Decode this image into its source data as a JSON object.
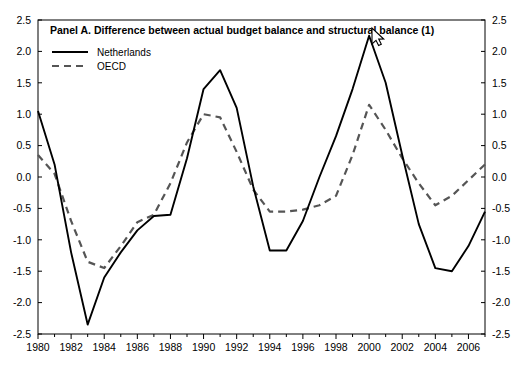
{
  "chart_data": {
    "type": "line",
    "title": "Panel A. Difference between actual budget balance and structural balance (1)",
    "xlabel": "",
    "ylabel": "",
    "ylim": [
      -2.5,
      2.5
    ],
    "xlim": [
      1980,
      2007
    ],
    "grid": false,
    "legend_position": "top-left",
    "y_ticks": [
      "2.5",
      "2.0",
      "1.5",
      "1.0",
      "0.5",
      "0.0",
      "-0.5",
      "-1.0",
      "-1.5",
      "-2.0",
      "-2.5"
    ],
    "y_tick_values": [
      2.5,
      2.0,
      1.5,
      1.0,
      0.5,
      0.0,
      -0.5,
      -1.0,
      -1.5,
      -2.0,
      -2.5
    ],
    "x_tick_labels": [
      "1980",
      "1982",
      "1984",
      "1986",
      "1988",
      "1990",
      "1992",
      "1994",
      "1996",
      "1998",
      "2000",
      "2002",
      "2004",
      "2006"
    ],
    "x_tick_values": [
      1980,
      1982,
      1984,
      1986,
      1988,
      1990,
      1992,
      1994,
      1996,
      1998,
      2000,
      2002,
      2004,
      2006
    ],
    "x": [
      1980,
      1981,
      1982,
      1983,
      1984,
      1985,
      1986,
      1987,
      1988,
      1989,
      1990,
      1991,
      1992,
      1993,
      1994,
      1995,
      1996,
      1997,
      1998,
      1999,
      2000,
      2001,
      2002,
      2003,
      2004,
      2005,
      2006,
      2007
    ],
    "series": [
      {
        "name": "Netherlands",
        "style": "solid",
        "color": "#000000",
        "values": [
          1.05,
          0.2,
          -1.2,
          -2.35,
          -1.6,
          -1.2,
          -0.85,
          -0.62,
          -0.6,
          0.3,
          1.4,
          1.7,
          1.1,
          -0.15,
          -1.17,
          -1.17,
          -0.7,
          0.0,
          0.65,
          1.4,
          2.25,
          1.5,
          0.35,
          -0.75,
          -1.45,
          -1.5,
          -1.1,
          -0.55
        ]
      },
      {
        "name": "OECD",
        "style": "dashed",
        "color": "#000000",
        "values": [
          0.35,
          0.05,
          -0.7,
          -1.35,
          -1.45,
          -1.1,
          -0.72,
          -0.6,
          -0.1,
          0.55,
          1.0,
          0.95,
          0.4,
          -0.2,
          -0.55,
          -0.55,
          -0.52,
          -0.45,
          -0.3,
          0.35,
          1.15,
          0.75,
          0.3,
          -0.1,
          -0.45,
          -0.3,
          -0.05,
          0.2
        ]
      }
    ]
  },
  "legend": {
    "items": [
      {
        "label": "Netherlands",
        "style": "solid"
      },
      {
        "label": "OECD",
        "style": "dashed"
      }
    ]
  },
  "cursor": {
    "visible": true,
    "x": 372,
    "y": 28
  }
}
